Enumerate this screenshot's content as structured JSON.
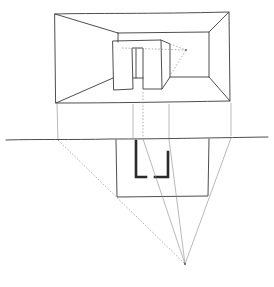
{
  "colors": {
    "ink": "#3a3a3a",
    "construction": "#8a8a8a",
    "background": "#ffffff"
  },
  "elements": {
    "perspective_view": "Room interior in one-point perspective with freestanding block and doorway",
    "picture_plane_line": "Horizontal picture-plane / ground line",
    "plan_view": "Plan rectangle with heavy U-shaped wall outline",
    "station_point": "Station point where projection rays converge"
  }
}
